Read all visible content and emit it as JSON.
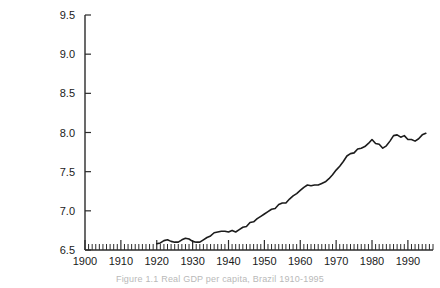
{
  "caption": "Figure 1.1 Real GDP per capita, Brazil 1910-1995",
  "colors": {
    "line": "#1c1c1c",
    "axis": "#2b2b2b",
    "background": "#ffffff",
    "caption": "#b9b9b9"
  },
  "chart_data": {
    "type": "line",
    "title": "",
    "subtitle": "",
    "xlabel": "",
    "ylabel": "",
    "xlim": [
      1900,
      1997
    ],
    "ylim": [
      6.5,
      9.5
    ],
    "grid": false,
    "legend": false,
    "legend_position": "none",
    "x_tick_labels": [
      "1900",
      "1910",
      "1920",
      "1930",
      "1940",
      "1950",
      "1960",
      "1970",
      "1980",
      "1990"
    ],
    "x_ticks": [
      1900,
      1910,
      1920,
      1930,
      1940,
      1950,
      1960,
      1970,
      1980,
      1990
    ],
    "x_minor_tick_step": 1,
    "y_tick_labels": [
      "6.5",
      "7.0",
      "7.5",
      "8.0",
      "8.5",
      "9.0",
      "9.5"
    ],
    "y_ticks": [
      6.5,
      7.0,
      7.5,
      8.0,
      8.5,
      9.0,
      9.5
    ],
    "series": [
      {
        "name": "Log real GDP per capita",
        "x": [
          1920,
          1921,
          1922,
          1923,
          1924,
          1925,
          1926,
          1927,
          1928,
          1929,
          1930,
          1931,
          1932,
          1933,
          1934,
          1935,
          1936,
          1937,
          1938,
          1939,
          1940,
          1941,
          1942,
          1943,
          1944,
          1945,
          1946,
          1947,
          1948,
          1949,
          1950,
          1951,
          1952,
          1953,
          1954,
          1955,
          1956,
          1957,
          1958,
          1959,
          1960,
          1961,
          1962,
          1963,
          1964,
          1965,
          1966,
          1967,
          1968,
          1969,
          1970,
          1971,
          1972,
          1973,
          1974,
          1975,
          1976,
          1977,
          1978,
          1979,
          1980,
          1981,
          1982,
          1983,
          1984,
          1985,
          1986,
          1987,
          1988,
          1989,
          1990,
          1991,
          1992,
          1993,
          1994,
          1995
        ],
        "values": [
          6.58,
          6.59,
          6.62,
          6.63,
          6.61,
          6.6,
          6.6,
          6.63,
          6.65,
          6.64,
          6.61,
          6.6,
          6.6,
          6.63,
          6.66,
          6.68,
          6.72,
          6.73,
          6.74,
          6.74,
          6.73,
          6.75,
          6.73,
          6.76,
          6.79,
          6.8,
          6.85,
          6.86,
          6.9,
          6.93,
          6.96,
          6.99,
          7.02,
          7.03,
          7.08,
          7.1,
          7.1,
          7.15,
          7.19,
          7.22,
          7.26,
          7.3,
          7.33,
          7.32,
          7.33,
          7.33,
          7.35,
          7.37,
          7.41,
          7.46,
          7.52,
          7.57,
          7.63,
          7.7,
          7.73,
          7.74,
          7.79,
          7.8,
          7.82,
          7.86,
          7.91,
          7.86,
          7.85,
          7.8,
          7.83,
          7.89,
          7.96,
          7.97,
          7.94,
          7.96,
          7.91,
          7.91,
          7.89,
          7.92,
          7.97,
          7.99
        ]
      }
    ]
  }
}
